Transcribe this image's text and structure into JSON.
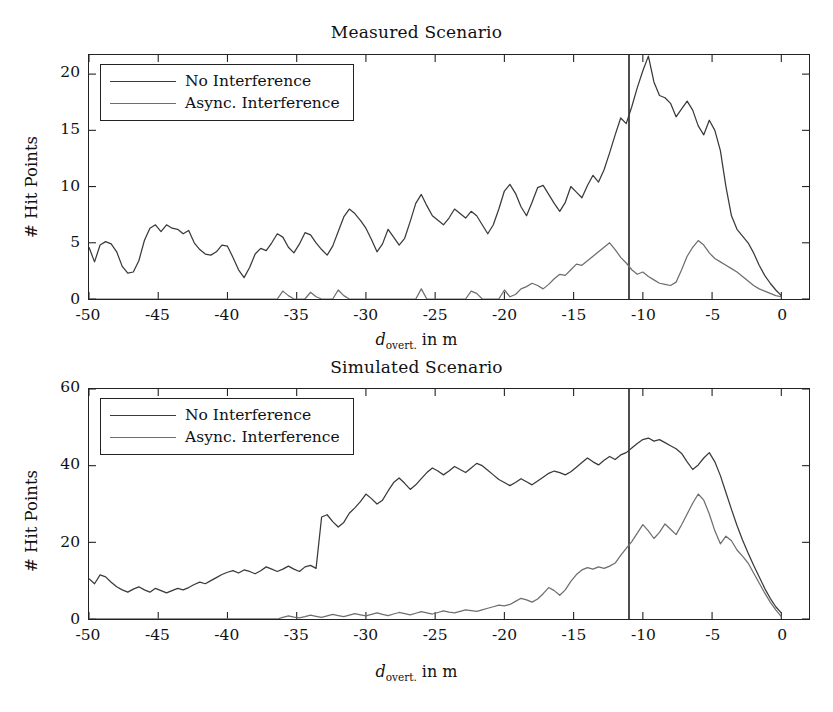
{
  "figure": {
    "background": "#ffffff",
    "ink_color": "#222222"
  },
  "panels": [
    {
      "id": "measured",
      "title": "Measured Scenario",
      "ylabel": "# Hit Points",
      "xlabel_var": "d",
      "xlabel_sub": "overt.",
      "xlabel_rest": " in m",
      "legend": [
        {
          "label": "No Interference",
          "color": "#3a3a3a"
        },
        {
          "label": "Async. Interference",
          "color": "#6e6e6e"
        }
      ],
      "yticks": [
        "0",
        "5",
        "10",
        "15",
        "20"
      ],
      "xticks": [
        "-50",
        "-45",
        "-40",
        "-35",
        "-30",
        "-25",
        "-20",
        "-15",
        "-10",
        "-5",
        "0"
      ]
    },
    {
      "id": "simulated",
      "title": "Simulated Scenario",
      "ylabel": "# Hit Points",
      "xlabel_var": "d",
      "xlabel_sub": "overt.",
      "xlabel_rest": " in m",
      "legend": [
        {
          "label": "No Interference",
          "color": "#3a3a3a"
        },
        {
          "label": "Async. Interference",
          "color": "#6e6e6e"
        }
      ],
      "yticks": [
        "0",
        "20",
        "40",
        "60"
      ],
      "xticks": [
        "-50",
        "-45",
        "-40",
        "-35",
        "-30",
        "-25",
        "-20",
        "-15",
        "-10",
        "-5",
        "0"
      ]
    }
  ],
  "chart_data": [
    {
      "type": "line",
      "id": "measured",
      "title": "Measured Scenario",
      "xlabel": "d_overt. in m",
      "ylabel": "# Hit Points",
      "xlim": [
        -50,
        2
      ],
      "ylim": [
        0,
        21.7
      ],
      "xticks": [
        -50,
        -45,
        -40,
        -35,
        -30,
        -25,
        -20,
        -15,
        -10,
        -5,
        0
      ],
      "yticks": [
        0,
        5,
        10,
        15,
        20
      ],
      "grid": false,
      "legend_position": "upper-left",
      "annotations": [
        {
          "type": "vline",
          "x": -11,
          "color": "#222222"
        }
      ],
      "x": [
        -50,
        -49.6,
        -49.2,
        -48.8,
        -48.4,
        -48,
        -47.6,
        -47.2,
        -46.8,
        -46.4,
        -46,
        -45.6,
        -45.2,
        -44.8,
        -44.4,
        -44,
        -43.6,
        -43.2,
        -42.8,
        -42.4,
        -42,
        -41.6,
        -41.2,
        -40.8,
        -40.4,
        -40,
        -39.6,
        -39.2,
        -38.8,
        -38.4,
        -38,
        -37.6,
        -37.2,
        -36.8,
        -36.4,
        -36,
        -35.6,
        -35.2,
        -34.8,
        -34.4,
        -34,
        -33.6,
        -33.2,
        -32.8,
        -32.4,
        -32,
        -31.6,
        -31.2,
        -30.8,
        -30.4,
        -30,
        -29.6,
        -29.2,
        -28.8,
        -28.4,
        -28,
        -27.6,
        -27.2,
        -26.8,
        -26.4,
        -26,
        -25.6,
        -25.2,
        -24.8,
        -24.4,
        -24,
        -23.6,
        -23.2,
        -22.8,
        -22.4,
        -22,
        -21.6,
        -21.2,
        -20.8,
        -20.4,
        -20,
        -19.6,
        -19.2,
        -18.8,
        -18.4,
        -18,
        -17.6,
        -17.2,
        -16.8,
        -16.4,
        -16,
        -15.6,
        -15.2,
        -14.8,
        -14.4,
        -14,
        -13.6,
        -13.2,
        -12.8,
        -12.4,
        -12,
        -11.6,
        -11.2,
        -10.8,
        -10.4,
        -10,
        -9.6,
        -9.2,
        -8.8,
        -8.4,
        -8,
        -7.6,
        -7.2,
        -6.8,
        -6.4,
        -6,
        -5.6,
        -5.2,
        -4.8,
        -4.4,
        -4,
        -3.6,
        -3.2,
        -2.8,
        -2.4,
        -2,
        -1.6,
        -1.2,
        -0.8,
        -0.4,
        0
      ],
      "series": [
        {
          "name": "No Interference",
          "color": "#3a3a3a",
          "values": [
            4.6,
            3.3,
            4.8,
            5.1,
            4.9,
            4.2,
            2.9,
            2.3,
            2.4,
            3.4,
            5.2,
            6.3,
            6.6,
            6.0,
            6.6,
            6.3,
            6.2,
            5.8,
            6.1,
            5.0,
            4.4,
            4.0,
            3.9,
            4.2,
            4.8,
            4.7,
            3.7,
            2.6,
            1.9,
            2.8,
            4.0,
            4.5,
            4.3,
            5.0,
            5.8,
            5.5,
            4.6,
            4.1,
            4.9,
            5.9,
            5.7,
            5.0,
            4.4,
            3.9,
            4.7,
            6.0,
            7.3,
            8.0,
            7.6,
            7.0,
            6.3,
            5.3,
            4.2,
            4.9,
            6.2,
            5.5,
            4.8,
            5.4,
            6.9,
            8.5,
            9.3,
            8.3,
            7.4,
            7.0,
            6.6,
            7.2,
            8.0,
            7.6,
            7.2,
            7.8,
            7.4,
            6.6,
            5.8,
            6.6,
            8.0,
            9.6,
            10.2,
            9.4,
            8.2,
            7.4,
            8.6,
            9.9,
            10.1,
            9.3,
            8.5,
            7.8,
            8.6,
            10.0,
            9.5,
            9.0,
            10.1,
            11.0,
            10.4,
            11.5,
            13.0,
            14.6,
            16.1,
            15.6,
            17.1,
            18.8,
            20.3,
            21.6,
            19.3,
            18.1,
            17.9,
            17.4,
            16.2,
            16.9,
            17.6,
            16.8,
            15.4,
            14.6,
            15.9,
            15.0,
            13.2,
            10.0,
            7.4,
            6.2,
            5.6,
            5.0,
            4.1,
            3.0,
            2.1,
            1.4,
            0.8,
            0.3
          ]
        },
        {
          "name": "Async. Interference",
          "color": "#6e6e6e",
          "values": [
            0,
            0,
            0,
            0,
            0,
            0,
            0,
            0,
            0,
            0,
            0,
            0,
            0,
            0,
            0,
            0,
            0,
            0,
            0,
            0,
            0,
            0,
            0,
            0,
            0,
            0,
            0,
            0,
            0,
            0,
            0,
            0,
            0,
            0,
            0,
            0.7,
            0.3,
            0,
            0,
            0,
            0.6,
            0.2,
            0,
            0,
            0,
            0.8,
            0.3,
            0,
            0,
            0,
            0,
            0,
            0,
            0,
            0,
            0,
            0,
            0,
            0,
            0,
            0.9,
            0,
            0,
            0,
            0,
            0,
            0,
            0,
            0,
            0.7,
            0.5,
            0,
            0,
            0,
            0,
            0.8,
            0.2,
            0.4,
            0.9,
            1.1,
            1.4,
            1.2,
            0.9,
            1.3,
            1.8,
            2.2,
            2.1,
            2.6,
            3.1,
            3.0,
            3.4,
            3.8,
            4.2,
            4.6,
            5.0,
            4.4,
            3.7,
            3.2,
            2.6,
            2.2,
            2.4,
            2.0,
            1.7,
            1.4,
            1.3,
            1.2,
            1.5,
            2.6,
            3.8,
            4.6,
            5.2,
            4.8,
            4.1,
            3.6,
            3.3,
            3.0,
            2.7,
            2.4,
            2.0,
            1.6,
            1.2,
            0.9,
            0.7,
            0.5,
            0.3,
            0.2,
            0.1
          ]
        }
      ]
    },
    {
      "type": "line",
      "id": "simulated",
      "title": "Simulated Scenario",
      "xlabel": "d_overt. in m",
      "ylabel": "# Hit Points",
      "xlim": [
        -50,
        2
      ],
      "ylim": [
        0,
        60
      ],
      "xticks": [
        -50,
        -45,
        -40,
        -35,
        -30,
        -25,
        -20,
        -15,
        -10,
        -5,
        0
      ],
      "yticks": [
        0,
        20,
        40,
        60
      ],
      "grid": false,
      "legend_position": "upper-left",
      "annotations": [
        {
          "type": "vline",
          "x": -11,
          "color": "#222222"
        }
      ],
      "x": [
        -50,
        -49.6,
        -49.2,
        -48.8,
        -48.4,
        -48,
        -47.6,
        -47.2,
        -46.8,
        -46.4,
        -46,
        -45.6,
        -45.2,
        -44.8,
        -44.4,
        -44,
        -43.6,
        -43.2,
        -42.8,
        -42.4,
        -42,
        -41.6,
        -41.2,
        -40.8,
        -40.4,
        -40,
        -39.6,
        -39.2,
        -38.8,
        -38.4,
        -38,
        -37.6,
        -37.2,
        -36.8,
        -36.4,
        -36,
        -35.6,
        -35.2,
        -34.8,
        -34.4,
        -34,
        -33.6,
        -33.2,
        -32.8,
        -32.4,
        -32,
        -31.6,
        -31.2,
        -30.8,
        -30.4,
        -30,
        -29.6,
        -29.2,
        -28.8,
        -28.4,
        -28,
        -27.6,
        -27.2,
        -26.8,
        -26.4,
        -26,
        -25.6,
        -25.2,
        -24.8,
        -24.4,
        -24,
        -23.6,
        -23.2,
        -22.8,
        -22.4,
        -22,
        -21.6,
        -21.2,
        -20.8,
        -20.4,
        -20,
        -19.6,
        -19.2,
        -18.8,
        -18.4,
        -18,
        -17.6,
        -17.2,
        -16.8,
        -16.4,
        -16,
        -15.6,
        -15.2,
        -14.8,
        -14.4,
        -14,
        -13.6,
        -13.2,
        -12.8,
        -12.4,
        -12,
        -11.6,
        -11.2,
        -10.8,
        -10.4,
        -10,
        -9.6,
        -9.2,
        -8.8,
        -8.4,
        -8,
        -7.6,
        -7.2,
        -6.8,
        -6.4,
        -6,
        -5.6,
        -5.2,
        -4.8,
        -4.4,
        -4,
        -3.6,
        -3.2,
        -2.8,
        -2.4,
        -2,
        -1.6,
        -1.2,
        -0.8,
        -0.4,
        0
      ],
      "series": [
        {
          "name": "No Interference",
          "color": "#3a3a3a",
          "values": [
            10.5,
            9.2,
            11.5,
            11.0,
            9.6,
            8.4,
            7.6,
            7.0,
            7.8,
            8.4,
            7.6,
            7.0,
            8.0,
            7.4,
            6.8,
            7.4,
            8.0,
            7.6,
            8.2,
            9.0,
            9.6,
            9.2,
            10.0,
            10.8,
            11.6,
            12.2,
            12.6,
            12.0,
            12.8,
            12.4,
            11.8,
            12.6,
            13.6,
            13.0,
            12.4,
            13.0,
            13.8,
            13.0,
            12.4,
            13.6,
            14.0,
            13.2,
            26.6,
            27.2,
            25.4,
            24.0,
            25.2,
            27.6,
            29.0,
            30.6,
            32.6,
            31.4,
            30.0,
            31.0,
            33.4,
            35.6,
            36.8,
            35.4,
            33.8,
            35.0,
            36.6,
            38.2,
            39.4,
            38.6,
            37.6,
            38.6,
            39.8,
            39.0,
            38.2,
            39.4,
            40.6,
            40.0,
            38.8,
            37.6,
            36.4,
            35.6,
            34.8,
            35.6,
            36.6,
            35.8,
            35.0,
            36.0,
            37.0,
            38.0,
            38.6,
            38.2,
            37.6,
            38.4,
            39.6,
            40.8,
            42.0,
            41.0,
            40.2,
            41.4,
            42.4,
            41.6,
            42.8,
            43.4,
            44.6,
            45.8,
            46.8,
            47.2,
            46.4,
            46.8,
            46.0,
            45.2,
            44.4,
            43.2,
            41.0,
            39.0,
            40.2,
            42.0,
            43.4,
            41.0,
            37.4,
            33.0,
            28.6,
            24.4,
            20.6,
            17.2,
            14.0,
            11.0,
            8.0,
            5.4,
            3.2,
            1.6,
            0.4
          ]
        },
        {
          "name": "Async. Interference",
          "color": "#6e6e6e",
          "values": [
            0,
            0,
            0,
            0,
            0,
            0,
            0,
            0,
            0,
            0,
            0,
            0,
            0,
            0,
            0,
            0,
            0,
            0,
            0,
            0,
            0,
            0,
            0,
            0,
            0,
            0,
            0,
            0,
            0,
            0,
            0,
            0,
            0,
            0,
            0,
            0.4,
            0.8,
            0.5,
            0.3,
            0.6,
            1.0,
            0.7,
            0.4,
            0.8,
            1.2,
            0.9,
            0.6,
            1.0,
            1.4,
            1.1,
            0.8,
            1.2,
            1.6,
            1.2,
            0.9,
            1.3,
            1.7,
            1.4,
            1.1,
            1.5,
            1.9,
            1.6,
            1.3,
            1.7,
            2.1,
            1.8,
            1.6,
            2.0,
            2.4,
            2.2,
            2.0,
            2.4,
            2.8,
            3.2,
            3.6,
            3.4,
            3.8,
            4.6,
            5.4,
            5.0,
            4.4,
            5.2,
            6.6,
            8.2,
            7.4,
            6.2,
            7.6,
            9.8,
            11.6,
            12.8,
            13.4,
            13.0,
            13.6,
            13.2,
            13.8,
            14.6,
            16.6,
            18.4,
            20.2,
            22.4,
            24.6,
            23.0,
            21.0,
            22.6,
            24.8,
            23.4,
            22.0,
            24.6,
            27.4,
            30.2,
            32.6,
            31.0,
            27.4,
            23.0,
            19.6,
            21.6,
            20.4,
            18.0,
            16.4,
            14.6,
            12.0,
            9.4,
            6.8,
            4.4,
            2.4,
            0.6
          ]
        }
      ]
    }
  ]
}
